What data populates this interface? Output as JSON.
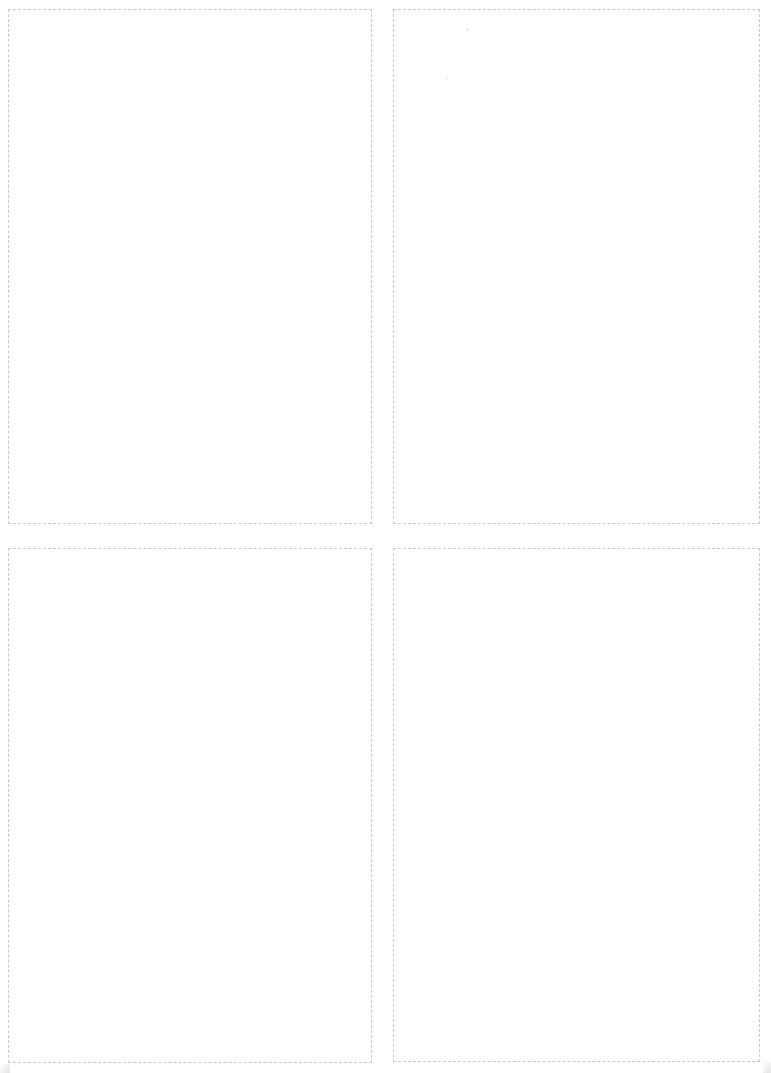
{
  "sheet": {
    "description": "Blank page with four dashed-outline cut panels in a 2x2 grid",
    "background": "#ffffff",
    "border_color": "#c8c8c8",
    "border_style": "dashed"
  },
  "panels": [
    {
      "id": "top-left",
      "label": "",
      "left": 8,
      "top": 9,
      "right": 372,
      "bottom": 524
    },
    {
      "id": "top-right",
      "label": "",
      "left": 393,
      "top": 9,
      "right": 760,
      "bottom": 524
    },
    {
      "id": "bottom-left",
      "label": "",
      "left": 8,
      "top": 548,
      "right": 372,
      "bottom": 1063
    },
    {
      "id": "bottom-right",
      "label": "",
      "left": 393,
      "top": 548,
      "right": 760,
      "bottom": 1062
    }
  ]
}
